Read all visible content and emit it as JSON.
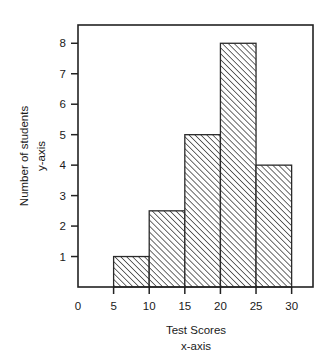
{
  "chart_data": {
    "type": "bar",
    "chart_subtype": "histogram",
    "title": "",
    "xlabel": "Test Scores",
    "xlabel_secondary": "x-axis",
    "ylabel": "Number of students",
    "ylabel_secondary": "y-axis",
    "categories": [
      "5-10",
      "10-15",
      "15-20",
      "20-25",
      "25-30"
    ],
    "bin_edges": [
      5,
      10,
      15,
      20,
      25,
      30
    ],
    "values": [
      1,
      2.5,
      5,
      8,
      4
    ],
    "x": [
      7.5,
      12.5,
      17.5,
      22.5,
      27.5
    ],
    "xlim": [
      0,
      33
    ],
    "ylim": [
      0,
      8.6
    ],
    "xticks": [
      0,
      5,
      10,
      15,
      20,
      25,
      30
    ],
    "xtick_labels": [
      "0",
      "5",
      "10",
      "15",
      "20",
      "25",
      "30"
    ],
    "yticks": [
      1,
      2,
      3,
      4,
      5,
      6,
      7,
      8
    ],
    "ytick_labels": [
      "1",
      "2",
      "3",
      "4",
      "5",
      "6",
      "7",
      "8"
    ],
    "grid": false,
    "legend": false,
    "legend_position": "none",
    "fill_pattern": "diagonal-hatch-forward",
    "colors": {
      "background": "#ffffff",
      "axis": "#222222",
      "bar_edge": "#2a2a2a",
      "bar_fill": "#ffffff",
      "hatch": "#3a3a3a",
      "text": "#1a1a1a"
    }
  }
}
